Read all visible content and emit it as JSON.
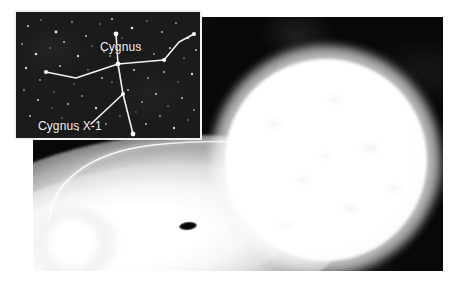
{
  "figure": {
    "panels": [
      "constellation-inset",
      "artist-illustration"
    ]
  },
  "inset": {
    "name": "Cygnus constellation star map",
    "background_color": "#1b1b1b",
    "border_color": "#f2f2f2",
    "line_color": "#f0f0f0",
    "star_color": "#ffffff",
    "labels": {
      "constellation": "Cygnus",
      "source": "Cygnus X-1"
    },
    "constellation_lines": [
      {
        "name": "long-axis-upper",
        "points": "100,22 102,52"
      },
      {
        "name": "long-axis-lower",
        "points": "102,52 107,82 117,122"
      },
      {
        "name": "left-wing",
        "points": "102,52 60,66 30,60"
      },
      {
        "name": "right-wing",
        "points": "102,52 148,48 163,30 178,22"
      },
      {
        "name": "pointer-to-cygnus-x1",
        "points": "107,82 75,112"
      }
    ],
    "marked_stars": [
      {
        "name": "deneb",
        "x": 100,
        "y": 22,
        "size": 4
      },
      {
        "name": "sadr",
        "x": 102,
        "y": 52,
        "size": 4
      },
      {
        "name": "gienah",
        "x": 30,
        "y": 60,
        "size": 3
      },
      {
        "name": "delta-cygni",
        "x": 148,
        "y": 48,
        "size": 3
      },
      {
        "name": "albireo",
        "x": 117,
        "y": 122,
        "size": 4
      },
      {
        "name": "cygnus-x-1-star",
        "x": 107,
        "y": 82,
        "size": 3
      },
      {
        "name": "wing-tip-right",
        "x": 178,
        "y": 22,
        "size": 3
      }
    ]
  },
  "illustration": {
    "name": "artist impression of Cygnus X-1 binary",
    "background_color": "#080808",
    "objects": [
      {
        "name": "blue-supergiant-star",
        "description": "bright glowing companion star, right side"
      },
      {
        "name": "accretion-disk",
        "description": "large elliptical glowing disk, lower left"
      },
      {
        "name": "black-hole",
        "description": "small dark spot at center of accretion disk"
      },
      {
        "name": "accretion-stream",
        "description": "thin bright stream of gas from star to disk"
      },
      {
        "name": "disk-hotspot",
        "description": "bright impact point where stream meets disk"
      }
    ]
  }
}
